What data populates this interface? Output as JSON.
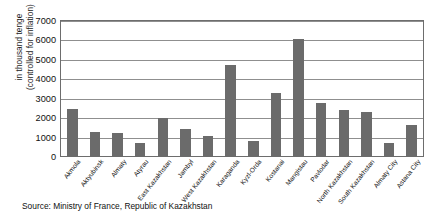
{
  "chart_data": {
    "type": "bar",
    "title": "",
    "xlabel": "",
    "ylabel_line1": "in thousand tenge",
    "ylabel_line2": "(controlled for inflation)",
    "ylim": [
      0,
      7000
    ],
    "ytick_labels": [
      "7000",
      "6000",
      "5000",
      "4000",
      "3000",
      "2000",
      "1000",
      "0"
    ],
    "ytick_values": [
      7000,
      6000,
      5000,
      4000,
      3000,
      2000,
      1000,
      0
    ],
    "grid": true,
    "legend": "none",
    "bar_color": "#6b6b6b",
    "categories": [
      "Akmola",
      "Aktyubinsk",
      "Almaty",
      "Atyrau",
      "East Kazakhstan",
      "Jambyl",
      "West Kazakhstan",
      "Karaganda",
      "Kyzl-Orda",
      "Kostanai",
      "Mangistau",
      "Pavlodar",
      "North Kazakhstan",
      "South Kazakhstan",
      "Almaty City",
      "Astana City"
    ],
    "values": [
      2450,
      1300,
      1250,
      700,
      2000,
      1450,
      1100,
      4750,
      800,
      3300,
      6100,
      2800,
      2400,
      2300,
      700,
      1650
    ]
  },
  "source_note": "Source: Ministry of France, Republic of Kazakhstan"
}
